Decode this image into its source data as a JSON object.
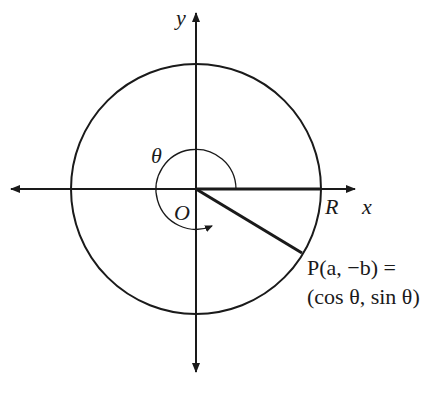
{
  "diagram": {
    "type": "unit-circle-angle",
    "colors": {
      "stroke": "#1a1a1a",
      "background": "#ffffff"
    },
    "axes": {
      "x_label": "x",
      "y_label": "y"
    },
    "labels": {
      "origin": "O",
      "radius_point": "R",
      "angle": "θ",
      "point_line1": "P(a, −b) =",
      "point_line2": "(cos θ, sin θ)"
    },
    "icons": [
      "arrow-left",
      "arrow-right",
      "arrow-up",
      "arrow-down",
      "angle-arc-arrow"
    ]
  }
}
